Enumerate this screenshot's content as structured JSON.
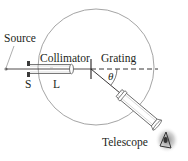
{
  "diagram": {
    "labels": {
      "source": "Source",
      "collimator": "Collimator",
      "grating": "Grating",
      "slit": "S",
      "lens": "L",
      "angle": "θ",
      "telescope": "Telescope"
    },
    "colors": {
      "line": "#231f20",
      "circle": "#9a9a9a",
      "tube": "#555555",
      "slit_block": "#3a3a3a"
    }
  }
}
